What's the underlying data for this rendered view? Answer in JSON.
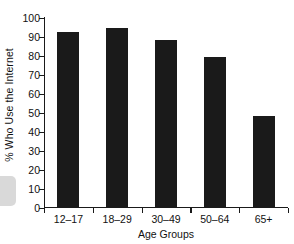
{
  "chart_data": {
    "type": "bar",
    "title": "",
    "categories": [
      "12–17",
      "18–29",
      "30–49",
      "50–64",
      "65+"
    ],
    "values": [
      92,
      94,
      88,
      79,
      48
    ],
    "xlabel": "Age Groups",
    "ylabel": "% Who Use the Internet",
    "ylim": [
      0,
      100
    ],
    "yticks": [
      0,
      10,
      20,
      30,
      40,
      50,
      60,
      70,
      80,
      90,
      100
    ],
    "ytick_labels": [
      "0",
      "10",
      "20",
      "30",
      "40",
      "50",
      "60",
      "70",
      "80",
      "90",
      "100"
    ],
    "grid": false,
    "legend": false,
    "bar_color": "#1a1a1a",
    "axis_color": "#1a1a1a"
  }
}
